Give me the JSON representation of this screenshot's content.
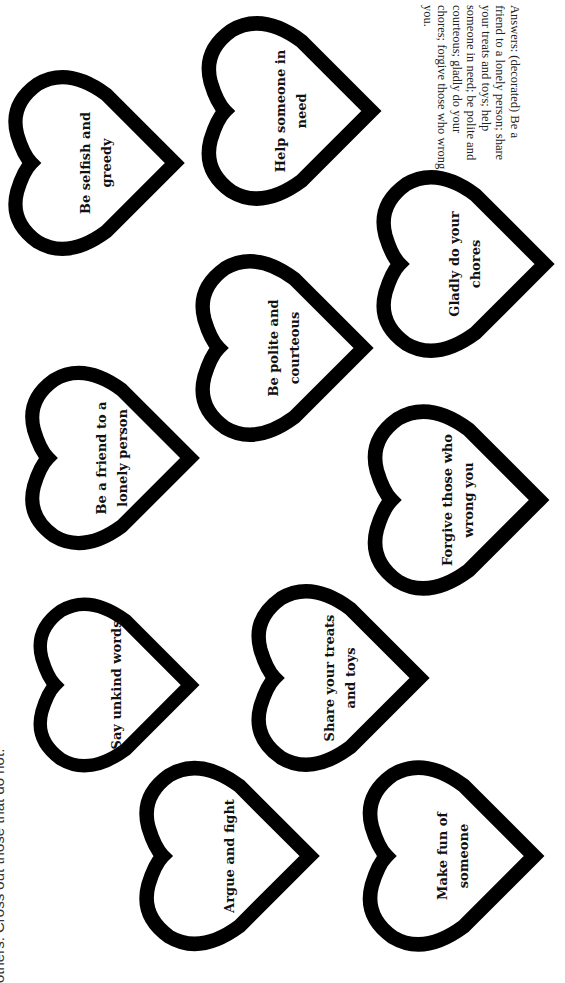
{
  "page": {
    "orientation": "rotated-90-clockwise",
    "instruction_visible_fragment": "others. Cross out those that do not.",
    "answers": "Answers: (decorated) Be a friend to a lonely person; share your treats and toys; help someone in need; be polite and courteous; gladly do your chores; forgive those who wrong you."
  },
  "colors": {
    "heart_outline": "#000000",
    "background": "#ffffff",
    "text": "#111111"
  },
  "hearts": [
    {
      "line1": "Be selfish and",
      "line2": "greedy"
    },
    {
      "line1": "Help someone in",
      "line2": "need"
    },
    {
      "line1": "Be polite and",
      "line2": "courteous"
    },
    {
      "line1": "Gladly do your",
      "line2": "chores"
    },
    {
      "line1": "Be a friend to a",
      "line2": "lonely person"
    },
    {
      "line1": "Forgive those who",
      "line2": "wrong you"
    },
    {
      "line1": "Say unkind words",
      "line2": ""
    },
    {
      "line1": "Share your treats",
      "line2": "and toys"
    },
    {
      "line1": "Argue and fight",
      "line2": ""
    },
    {
      "line1": "Make fun of",
      "line2": "someone"
    }
  ]
}
